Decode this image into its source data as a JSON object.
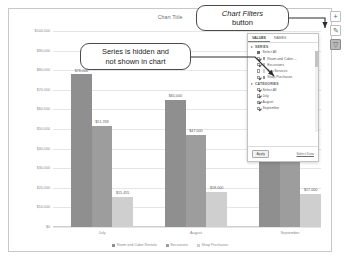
{
  "chart": {
    "title": "Chart Title",
    "side_buttons": [
      {
        "name": "chart-elements-button",
        "glyph": "+"
      },
      {
        "name": "chart-styles-button",
        "glyph": "✎"
      },
      {
        "name": "chart-filters-button",
        "glyph": "▽"
      }
    ]
  },
  "callouts": {
    "series": "Series is hidden and not shown in chart",
    "series_line1": "Series is hidden and",
    "series_line2": "not shown in chart",
    "filters_emphasis": "Chart Filters",
    "filters_rest": "button"
  },
  "filter_pane": {
    "tabs": [
      {
        "label": "VALUES",
        "selected": true
      },
      {
        "label": "NAMES",
        "selected": false
      }
    ],
    "series_header": "SERIES",
    "series_items": [
      {
        "label": "Select All",
        "checked": true,
        "swatch": false
      },
      {
        "label": "Room and Cabin ...",
        "checked": true,
        "swatch": true
      },
      {
        "label": "Excursions",
        "checked": true,
        "swatch": true
      },
      {
        "label": "Spa Services",
        "checked": false,
        "swatch": true
      },
      {
        "label": "Shop Purchases",
        "checked": true,
        "swatch": true
      }
    ],
    "categories_header": "CATEGORIES",
    "category_items": [
      {
        "label": "Select All",
        "checked": true
      },
      {
        "label": "July",
        "checked": true
      },
      {
        "label": "August",
        "checked": true
      },
      {
        "label": "September",
        "checked": true
      }
    ],
    "apply_label": "Apply",
    "select_data_label": "Select Data"
  },
  "chart_data": {
    "type": "bar",
    "title": "Chart Title",
    "xlabel": "",
    "ylabel": "",
    "ylim": [
      0,
      100000
    ],
    "grid": true,
    "legend_position": "bottom",
    "categories": [
      "July",
      "August",
      "September"
    ],
    "ytick_labels": [
      "$100,000",
      "$90,000",
      "$80,000",
      "$70,000",
      "$60,000",
      "$50,000",
      "$40,000",
      "$30,000",
      "$20,000",
      "$10,000",
      "$0"
    ],
    "ytick_values": [
      100000,
      90000,
      80000,
      70000,
      60000,
      50000,
      40000,
      30000,
      20000,
      10000,
      0
    ],
    "series": [
      {
        "name": "Room and Cabin Rentals",
        "color": "#8f8f8f",
        "values": [
          78000,
          65000,
          60000
        ],
        "labels": [
          "$78,000",
          "$65,000",
          ""
        ]
      },
      {
        "name": "Excursions",
        "color": "#9d9d9d",
        "values": [
          51769,
          47000,
          42000
        ],
        "labels": [
          "$51,769",
          "$47,000",
          ""
        ]
      },
      {
        "name": "Shop Purchases",
        "color": "#cfcfcf",
        "values": [
          15455,
          18000,
          17000
        ],
        "labels": [
          "$15,455",
          "$18,000",
          "$17,000"
        ]
      }
    ],
    "hidden_series": [
      "Spa Services"
    ]
  }
}
